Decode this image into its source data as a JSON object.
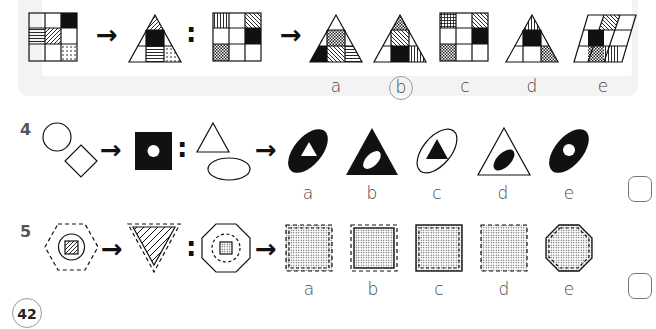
{
  "page_number": "42",
  "questions": [
    {
      "number": "3",
      "selected_answer": "b",
      "options": [
        "a",
        "b",
        "c",
        "d",
        "e"
      ],
      "description": "3x3 grid maps to triangle; analogous grid maps to which figure"
    },
    {
      "number": "4",
      "options": [
        "a",
        "b",
        "c",
        "d",
        "e"
      ],
      "description": "circle + diamond -> black square with white circle; triangle + ellipse -> ?"
    },
    {
      "number": "5",
      "options": [
        "a",
        "b",
        "c",
        "d",
        "e"
      ],
      "description": "dashed hexagon with nested circle and hatched square -> dashed inverted triangle; octagon with dashed circle and dotted square -> ?"
    }
  ],
  "symbols": {
    "arrow": "→",
    "colon": ":"
  },
  "colors": {
    "panel_bg": "#f3f3f3",
    "ink": "#111111",
    "label": "#444444"
  }
}
